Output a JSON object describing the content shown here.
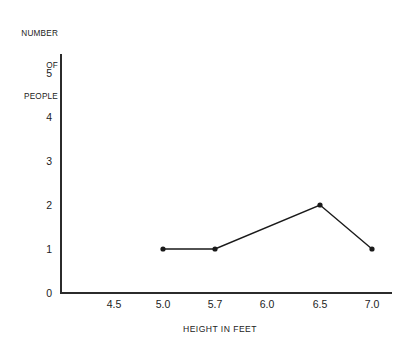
{
  "chart_data": {
    "type": "line",
    "title": "",
    "xlabel": "HEIGHT IN FEET",
    "ylabel": "NUMBER OF PEOPLE",
    "ylabel_lines": [
      "NUMBER",
      "OF",
      "PEOPLE"
    ],
    "x_tick_labels": [
      "4.5",
      "5.0",
      "5.7",
      "6.0",
      "6.5",
      "7.0"
    ],
    "y_tick_labels": [
      "0",
      "1",
      "2",
      "3",
      "4",
      "5"
    ],
    "ylim": [
      0,
      5
    ],
    "grid": false,
    "legend": false,
    "marker": "filled-circle",
    "line_color": "#1a1a1a",
    "marker_color": "#1a1a1a",
    "background_color": "#ffffff",
    "x": [
      5.0,
      5.7,
      6.5,
      7.0
    ],
    "values": [
      1,
      1,
      2,
      1
    ],
    "points": [
      {
        "x": "5.0",
        "y": 1
      },
      {
        "x": "5.7",
        "y": 1
      },
      {
        "x": "6.5",
        "y": 2
      },
      {
        "x": "7.0",
        "y": 1
      }
    ]
  },
  "axes": {
    "y_title_line1": "NUMBER",
    "y_title_line2": "OF",
    "y_title_line3": "PEOPLE",
    "x_title": "HEIGHT IN FEET",
    "ytick0": "0",
    "ytick1": "1",
    "ytick2": "2",
    "ytick3": "3",
    "ytick4": "4",
    "ytick5": "5",
    "xtick0": "4.5",
    "xtick1": "5.0",
    "xtick2": "5.7",
    "xtick3": "6.0",
    "xtick4": "6.5",
    "xtick5": "7.0"
  }
}
